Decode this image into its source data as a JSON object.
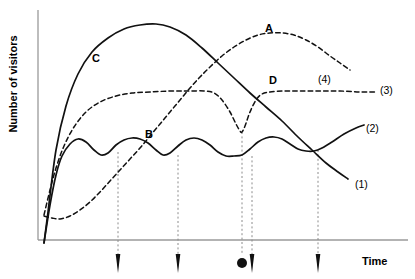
{
  "chart_data": {
    "type": "line",
    "title": "",
    "xlabel": "Time",
    "ylabel": "Number of visitors",
    "grid": false,
    "legend_position": "inline-end-of-curve",
    "axes": {
      "x_ticks": [],
      "y_ticks": [],
      "x_range_note": "unlabeled schematic time axis",
      "y_range_note": "unlabeled schematic count axis"
    },
    "point_labels": [
      {
        "text": "A",
        "x": 265,
        "y": 22
      },
      {
        "text": "B",
        "x": 145,
        "y": 128
      },
      {
        "text": "C",
        "x": 92,
        "y": 52
      },
      {
        "text": "D",
        "x": 269,
        "y": 74
      }
    ],
    "series_labels": [
      {
        "text": "(1)",
        "x": 355,
        "y": 178
      },
      {
        "text": "(2)",
        "x": 366,
        "y": 122
      },
      {
        "text": "(3)",
        "x": 380,
        "y": 84
      },
      {
        "text": "(4)",
        "x": 318,
        "y": 73
      }
    ],
    "series": [
      {
        "name": "(1)",
        "style": "solid",
        "description": "steep rise to broad maximum labelled C then steady decline through D to low right end labelled (1)",
        "points": [
          [
            44,
            243
          ],
          [
            48,
            212
          ],
          [
            56,
            150
          ],
          [
            66,
            106
          ],
          [
            78,
            74
          ],
          [
            92,
            52
          ],
          [
            108,
            38
          ],
          [
            124,
            29
          ],
          [
            140,
            25
          ],
          [
            156,
            24
          ],
          [
            170,
            27
          ],
          [
            186,
            35
          ],
          [
            202,
            48
          ],
          [
            218,
            63
          ],
          [
            234,
            78
          ],
          [
            250,
            93
          ],
          [
            266,
            107
          ],
          [
            282,
            121
          ],
          [
            298,
            137
          ],
          [
            312,
            150
          ],
          [
            326,
            163
          ],
          [
            338,
            172
          ],
          [
            348,
            179
          ]
        ]
      },
      {
        "name": "(2)",
        "style": "solid",
        "description": "oscillating wavy baseline labelled B that rises at the far right end labelled (2)",
        "points": [
          [
            44,
            243
          ],
          [
            50,
            205
          ],
          [
            56,
            175
          ],
          [
            62,
            156
          ],
          [
            70,
            144
          ],
          [
            78,
            139
          ],
          [
            86,
            142
          ],
          [
            94,
            150
          ],
          [
            101,
            155
          ],
          [
            108,
            153
          ],
          [
            116,
            145
          ],
          [
            124,
            140
          ],
          [
            132,
            138
          ],
          [
            140,
            139
          ],
          [
            148,
            143
          ],
          [
            156,
            150
          ],
          [
            163,
            155
          ],
          [
            170,
            153
          ],
          [
            178,
            146
          ],
          [
            186,
            140
          ],
          [
            194,
            138
          ],
          [
            202,
            140
          ],
          [
            210,
            145
          ],
          [
            218,
            152
          ],
          [
            226,
            156
          ],
          [
            234,
            156
          ],
          [
            242,
            155
          ],
          [
            250,
            149
          ],
          [
            258,
            142
          ],
          [
            266,
            138
          ],
          [
            274,
            137
          ],
          [
            282,
            139
          ],
          [
            290,
            144
          ],
          [
            298,
            149
          ],
          [
            306,
            151
          ],
          [
            314,
            151
          ],
          [
            322,
            148
          ],
          [
            332,
            142
          ],
          [
            344,
            134
          ],
          [
            356,
            128
          ],
          [
            364,
            125
          ]
        ]
      },
      {
        "name": "(3)",
        "style": "dashed",
        "description": "fast early rise to a long flat plateau, with a sharp narrow V-shaped dip at the circle marker, recovering to the plateau and running flat to the right end labelled (3) with callout (4)",
        "points": [
          [
            44,
            215
          ],
          [
            50,
            190
          ],
          [
            56,
            168
          ],
          [
            64,
            146
          ],
          [
            74,
            127
          ],
          [
            86,
            112
          ],
          [
            100,
            102
          ],
          [
            116,
            96
          ],
          [
            132,
            93
          ],
          [
            150,
            92
          ],
          [
            170,
            91
          ],
          [
            188,
            91
          ],
          [
            204,
            91
          ],
          [
            214,
            93
          ],
          [
            222,
            100
          ],
          [
            230,
            112
          ],
          [
            236,
            124
          ],
          [
            240,
            131
          ],
          [
            242,
            132
          ],
          [
            245,
            126
          ],
          [
            250,
            112
          ],
          [
            256,
            100
          ],
          [
            262,
            94
          ],
          [
            270,
            92
          ],
          [
            284,
            91
          ],
          [
            300,
            91
          ],
          [
            320,
            91
          ],
          [
            340,
            91
          ],
          [
            360,
            92
          ],
          [
            375,
            92
          ]
        ]
      },
      {
        "name": "(4)",
        "style": "dashed",
        "description": "flat low start, slow then accelerating rise crossing the other curves, broad maximum labelled A, then decline to the right",
        "points": [
          [
            44,
            216
          ],
          [
            52,
            218
          ],
          [
            60,
            219
          ],
          [
            70,
            216
          ],
          [
            80,
            210
          ],
          [
            90,
            202
          ],
          [
            100,
            192
          ],
          [
            110,
            181
          ],
          [
            120,
            170
          ],
          [
            130,
            159
          ],
          [
            140,
            148
          ],
          [
            150,
            136
          ],
          [
            160,
            124
          ],
          [
            170,
            112
          ],
          [
            180,
            100
          ],
          [
            190,
            88
          ],
          [
            200,
            77
          ],
          [
            210,
            67
          ],
          [
            222,
            56
          ],
          [
            234,
            47
          ],
          [
            246,
            40
          ],
          [
            258,
            35
          ],
          [
            270,
            33
          ],
          [
            282,
            33
          ],
          [
            294,
            35
          ],
          [
            306,
            40
          ],
          [
            318,
            47
          ],
          [
            330,
            56
          ],
          [
            340,
            63
          ],
          [
            350,
            70
          ]
        ]
      }
    ],
    "axis_markers": {
      "description": "vertical dotted drop-lines with markers below the time axis",
      "triangle_marker_x": [
        118,
        178,
        252,
        318
      ],
      "circle_marker_x": [
        242
      ],
      "axis_y": 240,
      "marker_y": 262
    }
  }
}
